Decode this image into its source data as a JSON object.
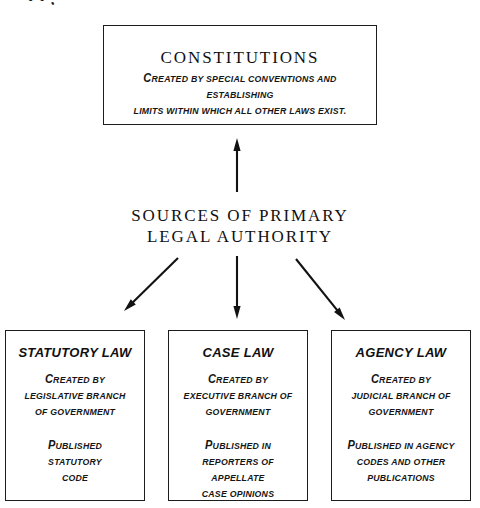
{
  "page": {
    "title": "Sources of Primary Legal Authority",
    "background_color": "#ffffff",
    "ink_color": "#111111",
    "top_fragment_text": "•  •   ,"
  },
  "center_label": {
    "line1": "SOURCES OF PRIMARY",
    "line2": "LEGAL AUTHORITY"
  },
  "constitutions": {
    "heading": "CONSTITUTIONS",
    "line1": "Created by special conventions and establishing",
    "line2": "limits within which all other laws exist."
  },
  "boxes": [
    {
      "id": "statutory",
      "heading": "STATUTORY LAW",
      "block1": [
        "Created by",
        "legislative branch",
        "of government"
      ],
      "block2": [
        "Published",
        "statutory",
        "code"
      ]
    },
    {
      "id": "case",
      "heading": "CASE LAW",
      "block1": [
        "Created by",
        "executive branch of",
        "government"
      ],
      "block2": [
        "Published in",
        "reporters of appellate",
        "case opinions"
      ]
    },
    {
      "id": "agency",
      "heading": "AGENCY LAW",
      "block1": [
        "Created by",
        "judicial branch of",
        "government"
      ],
      "block2": [
        "Published in agency",
        "codes and other",
        "publications"
      ]
    }
  ],
  "arrows": [
    {
      "name": "arrow-up-to-constitutions",
      "from": [
        237,
        192
      ],
      "to": [
        237,
        138
      ],
      "direction": "up"
    },
    {
      "name": "arrow-down-left-to-statutory",
      "from": [
        178,
        258
      ],
      "to": [
        124,
        311
      ],
      "direction": "down-left"
    },
    {
      "name": "arrow-down-to-case",
      "from": [
        237,
        256
      ],
      "to": [
        237,
        319
      ],
      "direction": "down"
    },
    {
      "name": "arrow-down-right-to-agency",
      "from": [
        296,
        259
      ],
      "to": [
        345,
        320
      ],
      "direction": "down-right"
    }
  ]
}
